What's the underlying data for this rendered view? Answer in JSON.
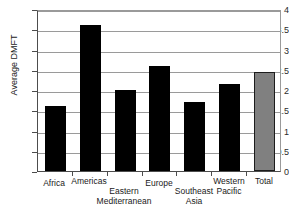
{
  "chart_data": {
    "type": "bar",
    "title": "",
    "xlabel": "",
    "ylabel": "Average DMFT",
    "categories": [
      "Africa",
      "Americas",
      "Eastern Mediterranean",
      "Europe",
      "Southeast Asia",
      "Western Pacific",
      "Total"
    ],
    "category_lines": [
      [
        "Africa"
      ],
      [
        "Americas"
      ],
      [
        "Eastern",
        "Mediterranean"
      ],
      [
        "Europe"
      ],
      [
        "Southeast",
        "Asia"
      ],
      [
        "Western",
        "Pacific"
      ],
      [
        "Total"
      ]
    ],
    "values": [
      1.6,
      3.6,
      2.0,
      2.6,
      1.7,
      2.15,
      2.45
    ],
    "ylim": [
      0,
      4
    ],
    "yticks": [
      0,
      0.5,
      1,
      1.5,
      2,
      2.5,
      3,
      3.5,
      4
    ],
    "ytick_labels": [
      "0",
      "0.5",
      "1",
      "1.5",
      "2",
      "2.5",
      "3",
      "3.5",
      "4"
    ],
    "grid": true,
    "legend": "none",
    "bar_colors": [
      "#000000",
      "#000000",
      "#000000",
      "#000000",
      "#000000",
      "#000000",
      "#808080"
    ]
  },
  "axis": {
    "y_title": "Average DMFT"
  }
}
